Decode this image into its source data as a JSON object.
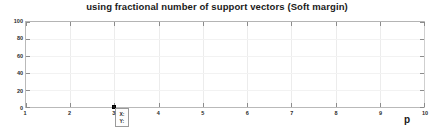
{
  "chart_data": {
    "type": "line",
    "title": "using fractional number of support vectors (Soft margin)",
    "xlabel": "p",
    "ylabel": "",
    "xlim": [
      1,
      10
    ],
    "ylim": [
      0,
      100
    ],
    "x_ticks": [
      1,
      2,
      3,
      4,
      5,
      6,
      7,
      8,
      9,
      10
    ],
    "x_tick_labels": [
      "1",
      "2",
      "3",
      "4",
      "5",
      "6",
      "7",
      "8",
      "9",
      "10"
    ],
    "y_ticks": [
      0,
      20,
      40,
      60,
      80,
      100
    ],
    "y_tick_labels": [
      "0",
      "20",
      "40",
      "60",
      "80",
      "100"
    ],
    "grid": true,
    "legend": "none",
    "series": [
      {
        "name": "fractional number of support vectors",
        "x": [
          1,
          2,
          3,
          4,
          5,
          6,
          7,
          8,
          9,
          10
        ],
        "values": [
          0,
          0,
          0,
          0,
          0,
          0,
          0,
          0,
          0,
          0
        ]
      }
    ],
    "annotations": [
      {
        "type": "data-cursor",
        "x": 3,
        "y": 0,
        "lines": [
          {
            "key": "X:",
            "value": ""
          },
          {
            "key": "Y:",
            "value": ""
          }
        ]
      }
    ]
  },
  "axes": {
    "x_ticks": [
      {
        "label": "1",
        "pct": 0
      },
      {
        "label": "2",
        "pct": 11.111
      },
      {
        "label": "3",
        "pct": 22.222
      },
      {
        "label": "4",
        "pct": 33.333
      },
      {
        "label": "5",
        "pct": 44.444
      },
      {
        "label": "6",
        "pct": 55.555
      },
      {
        "label": "7",
        "pct": 66.666
      },
      {
        "label": "8",
        "pct": 77.777
      },
      {
        "label": "9",
        "pct": 88.888
      },
      {
        "label": "10",
        "pct": 100
      }
    ],
    "y_ticks": [
      {
        "label": "100",
        "pct": 0
      },
      {
        "label": "80",
        "pct": 20
      },
      {
        "label": "60",
        "pct": 40
      },
      {
        "label": "40",
        "pct": 60
      },
      {
        "label": "20",
        "pct": 80
      },
      {
        "label": "0",
        "pct": 100
      }
    ]
  },
  "title": "using fractional number of support vectors (Soft margin)",
  "x_axis_label": "p",
  "cursor": {
    "x_key": "X:",
    "x_value": "",
    "y_key": "Y:",
    "y_value": ""
  },
  "colors": {
    "axis_line": "#b9b9b9",
    "grid": "#ececec",
    "tick_mark": "#8c8c8c",
    "text": "#1a1a1a",
    "marker": "#1c1c1c",
    "tooltip_border": "#9a9a9a",
    "background": "#ffffff"
  }
}
